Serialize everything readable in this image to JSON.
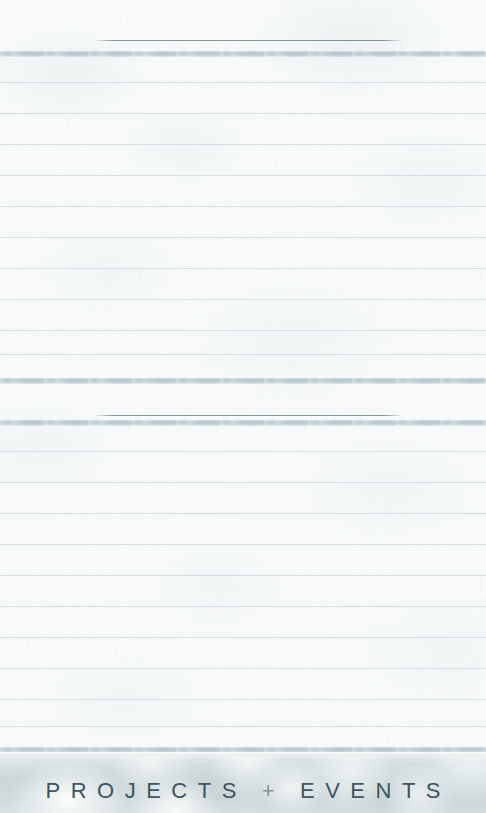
{
  "page": {
    "width": 486,
    "height": 813,
    "background_color": "#fbfcfc",
    "paper_tint": "#fbfdfd"
  },
  "colors": {
    "rule_line": "#cfdee0",
    "divider_band": "#b0c4ca",
    "hairline": "#768c94",
    "footer_background": "#c3d0d2",
    "footer_text": "#3c5560",
    "footer_plus": "#7c949d"
  },
  "sections": {
    "top_margin": {
      "name": "top-blank-margin",
      "height": 40
    },
    "upper_block": {
      "name": "upper-writing-block",
      "hairline": {
        "x_start": 95,
        "x_end": 402,
        "y": 40
      },
      "band_y": 51,
      "rule_count": 11,
      "rule_spacing": 31,
      "first_rule_y": 82,
      "closing_band_y": 378
    },
    "lower_block": {
      "name": "lower-writing-block",
      "hairline": {
        "x_start": 95,
        "x_end": 402,
        "y": 415
      },
      "band_y": 420,
      "rule_count": 11,
      "rule_spacing": 31,
      "first_rule_y": 451,
      "closing_band_y": 747
    }
  },
  "footer": {
    "name": "projects-events-footer",
    "top": 752,
    "height": 61,
    "title_parts": {
      "left": "PROJECTS",
      "separator": "+",
      "right": "EVENTS"
    },
    "title_full": "PROJECTS + EVENTS",
    "letter_spacing_px": 10.5,
    "font_size_px": 22,
    "baseline_y": 790
  }
}
